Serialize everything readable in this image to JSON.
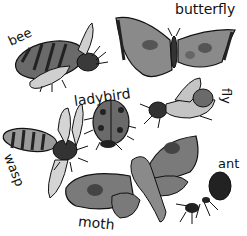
{
  "illustration": {
    "colors": {
      "ink": "#111111",
      "wash_dark": "#555555",
      "wash_mid": "#8a8a8a",
      "wash_light": "#c4c4c4",
      "background": "#ffffff"
    },
    "labels": [
      {
        "id": "bee",
        "text": "bee"
      },
      {
        "id": "butterfly",
        "text": "butterfly"
      },
      {
        "id": "ladybird",
        "text": "ladybird"
      },
      {
        "id": "fly",
        "text": "fly"
      },
      {
        "id": "wasp",
        "text": "wasp"
      },
      {
        "id": "moth",
        "text": "moth"
      },
      {
        "id": "ant",
        "text": "ant"
      }
    ]
  }
}
